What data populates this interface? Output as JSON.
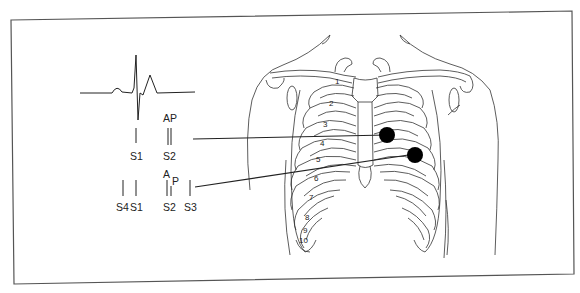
{
  "figure": {
    "frame_color": "#555555",
    "ink_color": "#222222",
    "ecg": {
      "label": "ECG trace",
      "waves": [
        "P",
        "QRS",
        "T"
      ]
    },
    "heart_sounds_normal": {
      "sounds": [
        {
          "label": "S1"
        },
        {
          "label": "S2",
          "components_label": "AP"
        }
      ]
    },
    "heart_sounds_split": {
      "sounds": [
        {
          "label": "S4"
        },
        {
          "label": "S1"
        },
        {
          "label": "S2",
          "component_a": "A",
          "component_p": "P"
        },
        {
          "label": "S3"
        }
      ]
    },
    "chest": {
      "rib_numbers": [
        "1",
        "2",
        "3",
        "4",
        "5",
        "6",
        "7",
        "8",
        "9",
        "10"
      ],
      "auscultation_points": [
        {
          "name": "upper-point",
          "color": "#000000"
        },
        {
          "name": "lower-point",
          "color": "#000000"
        }
      ]
    }
  }
}
